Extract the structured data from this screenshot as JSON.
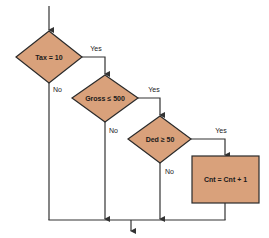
{
  "diagram": {
    "type": "flowchart",
    "colors": {
      "fill": "#D9A17B",
      "stroke": "#2a2a2a",
      "line": "#333333",
      "background": "#ffffff"
    },
    "nodes": [
      {
        "id": "d1",
        "shape": "diamond",
        "label": "Tax = 10"
      },
      {
        "id": "d2",
        "shape": "diamond",
        "label": "Gross ≤ 500"
      },
      {
        "id": "d3",
        "shape": "diamond",
        "label": "Ded ≥ 50"
      },
      {
        "id": "p1",
        "shape": "rectangle",
        "label": "Cnt = Cnt + 1"
      }
    ],
    "edges": [
      {
        "from": "start",
        "to": "d1",
        "label": ""
      },
      {
        "from": "d1",
        "to": "d2",
        "label": "Yes"
      },
      {
        "from": "d1",
        "to": "join",
        "label": "No"
      },
      {
        "from": "d2",
        "to": "d3",
        "label": "Yes"
      },
      {
        "from": "d2",
        "to": "join",
        "label": "No"
      },
      {
        "from": "d3",
        "to": "p1",
        "label": "Yes"
      },
      {
        "from": "d3",
        "to": "join",
        "label": "No"
      },
      {
        "from": "p1",
        "to": "join",
        "label": ""
      },
      {
        "from": "join",
        "to": "end",
        "label": ""
      }
    ],
    "labels": {
      "yes": "Yes",
      "no": "No"
    }
  }
}
